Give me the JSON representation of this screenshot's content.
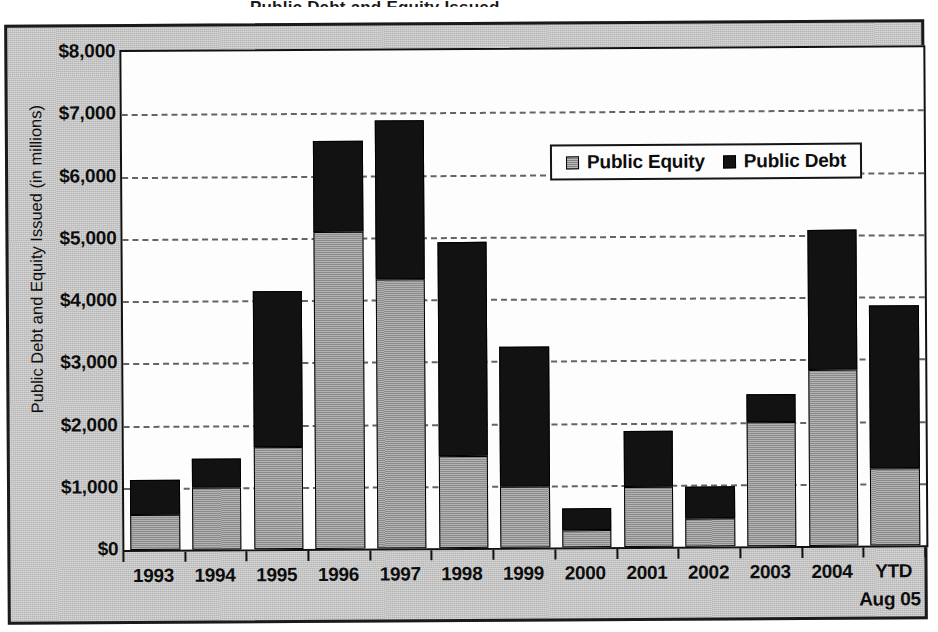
{
  "cropped_title_fragment": "Public Debt and Equity Issued",
  "chart_data": {
    "type": "bar",
    "subtype": "stacked-bar",
    "title": "",
    "xlabel": "",
    "ylabel": "Public Debt and Equity Issued (in millions)",
    "ylim": [
      0,
      8000
    ],
    "ytick_step": 1000,
    "ytick_labels": [
      "$0",
      "$1,000",
      "$2,000",
      "$3,000",
      "$4,000",
      "$5,000",
      "$6,000",
      "$7,000",
      "$8,000"
    ],
    "ytick_values": [
      0,
      1000,
      2000,
      3000,
      4000,
      5000,
      6000,
      7000,
      8000
    ],
    "grid": true,
    "grid_style": "dashed-horizontal",
    "legend_position": "upper-right-inside",
    "categories": [
      "1993",
      "1994",
      "1995",
      "1996",
      "1997",
      "1998",
      "1999",
      "2000",
      "2001",
      "2002",
      "2003",
      "2004",
      "YTD"
    ],
    "category_sublabels": [
      "",
      "",
      "",
      "",
      "",
      "",
      "",
      "",
      "",
      "",
      "",
      "",
      "Aug 05"
    ],
    "series": [
      {
        "name": "Public Equity",
        "color": "#9a9a9a",
        "values": [
          570,
          990,
          1640,
          5100,
          4320,
          1480,
          980,
          280,
          960,
          450,
          2000,
          2820,
          1230
        ]
      },
      {
        "name": "Public Debt",
        "color": "#121212",
        "values": [
          550,
          470,
          2500,
          1450,
          2550,
          3440,
          2250,
          340,
          910,
          510,
          440,
          2260,
          2620
        ]
      }
    ],
    "totals": [
      1120,
      1460,
      4140,
      6550,
      6870,
      4920,
      3230,
      620,
      1870,
      960,
      2440,
      5080,
      3850
    ]
  },
  "legend": {
    "items": [
      {
        "label": "Public Equity",
        "swatch": "equity"
      },
      {
        "label": "Public Debt",
        "swatch": "debt"
      }
    ]
  },
  "colors": {
    "equity": "#9a9a9a",
    "debt": "#121212",
    "frame_background": "#c9c9c9",
    "plot_background": "#fdfdfd",
    "axis": "#111111"
  }
}
